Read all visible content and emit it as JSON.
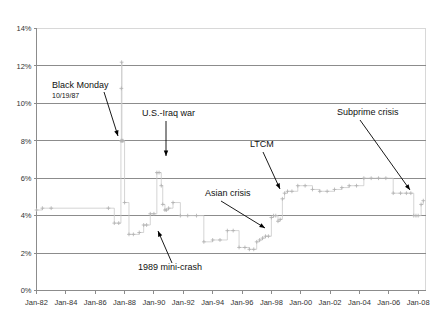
{
  "chart_data": {
    "type": "line",
    "title": "",
    "subtitle": "",
    "xlabel": "",
    "ylabel": "",
    "grid": true,
    "legend": "none",
    "xlim": [
      1982,
      2008.5
    ],
    "ylim": [
      0,
      14
    ],
    "y_ticks": [
      "0%",
      "2%",
      "4%",
      "6%",
      "8%",
      "10%",
      "12%",
      "14%"
    ],
    "y_tick_values": [
      0,
      2,
      4,
      6,
      8,
      10,
      12,
      14
    ],
    "x_ticks": [
      "Jan-82",
      "Jan-84",
      "Jan-86",
      "Jan-88",
      "Jan-90",
      "Jan-92",
      "Jan-94",
      "Jan-96",
      "Jan-98",
      "Jan-00",
      "Jan-02",
      "Jan-04",
      "Jan-06",
      "Jan-08"
    ],
    "x_tick_values": [
      1982,
      1984,
      1986,
      1988,
      1990,
      1992,
      1994,
      1996,
      1998,
      2000,
      2002,
      2004,
      2006,
      2008
    ],
    "series": [
      {
        "name": "Margin requirement",
        "color": "#c9c9c9",
        "marker": "plus",
        "x": [
          1982.0,
          1982.4,
          1983.0,
          1986.9,
          1987.3,
          1987.6,
          1987.75,
          1987.78,
          1987.8,
          1987.82,
          1987.84,
          1987.9,
          1988.0,
          1988.3,
          1988.6,
          1989.0,
          1989.3,
          1989.5,
          1989.75,
          1990.0,
          1990.2,
          1990.35,
          1990.5,
          1990.6,
          1990.75,
          1990.85,
          1991.0,
          1991.3,
          1991.8,
          1992.3,
          1992.9,
          1993.4,
          1994.0,
          1994.5,
          1995.0,
          1995.4,
          1995.8,
          1996.2,
          1996.5,
          1996.8,
          1997.0,
          1997.2,
          1997.4,
          1997.6,
          1997.8,
          1998.0,
          1998.15,
          1998.3,
          1998.45,
          1998.6,
          1998.75,
          1998.9,
          1999.1,
          1999.4,
          1999.8,
          2000.3,
          2000.8,
          2001.3,
          2001.8,
          2002.3,
          2002.8,
          2003.3,
          2003.8,
          2004.3,
          2004.8,
          2005.3,
          2005.8,
          2006.3,
          2006.8,
          2007.2,
          2007.5,
          2007.7,
          2007.85,
          2008.0,
          2008.2,
          2008.35
        ],
        "y": [
          4.3,
          4.4,
          4.4,
          4.4,
          3.6,
          3.6,
          8.0,
          10.8,
          12.2,
          8.0,
          8.0,
          8.0,
          4.7,
          3.0,
          3.0,
          3.1,
          3.5,
          3.5,
          4.1,
          4.1,
          6.3,
          6.3,
          5.6,
          4.6,
          4.3,
          4.3,
          4.4,
          4.7,
          4.0,
          4.0,
          4.0,
          2.6,
          2.7,
          2.7,
          3.2,
          3.2,
          2.3,
          2.3,
          2.2,
          2.2,
          2.6,
          2.7,
          2.8,
          2.9,
          2.9,
          3.9,
          4.0,
          4.0,
          3.7,
          3.8,
          4.9,
          5.2,
          5.3,
          5.3,
          5.6,
          5.6,
          5.4,
          5.3,
          5.3,
          5.4,
          5.5,
          5.6,
          5.6,
          6.0,
          6.0,
          6.0,
          6.0,
          5.2,
          5.2,
          5.2,
          5.2,
          4.0,
          4.0,
          4.0,
          4.6,
          4.8
        ]
      }
    ],
    "annotations": [
      {
        "id": "black-monday",
        "label": "Black Monday",
        "sublabel": "10/19/87",
        "text_x": 52,
        "text_y": 88,
        "sub_x": 52,
        "sub_y": 98,
        "arrow_x1": 104,
        "arrow_y1": 92,
        "arrow_x2": 118,
        "arrow_y2": 136
      },
      {
        "id": "us-iraq-war",
        "label": "U.S.-Iraq war",
        "sublabel": "",
        "text_x": 142,
        "text_y": 116,
        "sub_x": 0,
        "sub_y": 0,
        "arrow_x1": 166,
        "arrow_y1": 121,
        "arrow_x2": 166,
        "arrow_y2": 156
      },
      {
        "id": "ltcm",
        "label": "LTCM",
        "sublabel": "",
        "text_x": 250,
        "text_y": 147,
        "sub_x": 0,
        "sub_y": 0,
        "arrow_x1": 263,
        "arrow_y1": 152,
        "arrow_x2": 280,
        "arrow_y2": 189
      },
      {
        "id": "subprime-crisis",
        "label": "Subprime crisis",
        "sublabel": "",
        "text_x": 337,
        "text_y": 115,
        "sub_x": 0,
        "sub_y": 0,
        "arrow_x1": 360,
        "arrow_y1": 120,
        "arrow_x2": 410,
        "arrow_y2": 190
      },
      {
        "id": "asian-crisis",
        "label": "Asian crisis",
        "sublabel": "",
        "text_x": 205,
        "text_y": 196,
        "sub_x": 0,
        "sub_y": 0,
        "arrow_x1": 221,
        "arrow_y1": 201,
        "arrow_x2": 265,
        "arrow_y2": 228
      },
      {
        "id": "1989-mini-crash",
        "label": "1989 mini-crash",
        "sublabel": "",
        "text_x": 138,
        "text_y": 270,
        "sub_x": 0,
        "sub_y": 0,
        "arrow_x1": 172,
        "arrow_y1": 263,
        "arrow_x2": 158,
        "arrow_y2": 231
      }
    ]
  },
  "colors": {
    "grid": "#8c8c8c",
    "series": "#c9c9c9",
    "text": "#111111",
    "frame": "#d8d8d8",
    "background": "#ffffff"
  }
}
